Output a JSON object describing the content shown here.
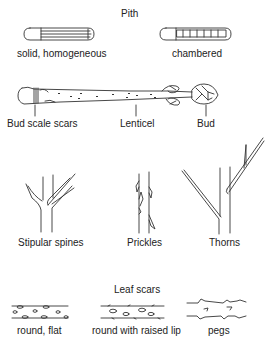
{
  "pith": {
    "title": "Pith",
    "types": [
      {
        "label": "solid, homogeneous",
        "icon": "solid-pith-twig-icon"
      },
      {
        "label": "chambered",
        "icon": "chambered-pith-twig-icon"
      }
    ]
  },
  "twig": {
    "icon": "twig-icon",
    "labels": [
      {
        "label": "Bud scale scars"
      },
      {
        "label": "Lenticel"
      },
      {
        "label": "Bud"
      }
    ]
  },
  "armature": {
    "types": [
      {
        "label": "Stipular spines",
        "icon": "stipular-spines-icon"
      },
      {
        "label": "Prickles",
        "icon": "prickles-icon"
      },
      {
        "label": "Thorns",
        "icon": "thorns-icon"
      }
    ]
  },
  "leaf_scars": {
    "title": "Leaf scars",
    "types": [
      {
        "label": "round, flat",
        "icon": "round-flat-scar-icon"
      },
      {
        "label": "round with raised lip",
        "icon": "raised-lip-scar-icon"
      },
      {
        "label": "pegs",
        "icon": "pegs-scar-icon"
      }
    ]
  }
}
